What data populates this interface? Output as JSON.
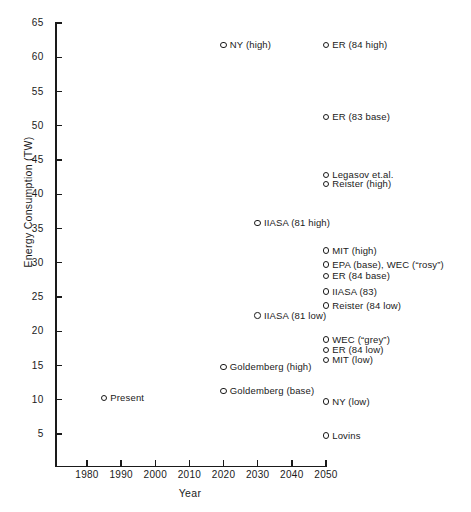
{
  "chart_data": {
    "type": "scatter",
    "title": "",
    "xlabel": "Year",
    "ylabel": "Energy Consumption (TW)",
    "xlim": [
      1972,
      2052
    ],
    "ylim": [
      0,
      65
    ],
    "xticks": [
      1980,
      1990,
      2000,
      2010,
      2020,
      2030,
      2040,
      2050
    ],
    "yticks": [
      5,
      10,
      15,
      20,
      25,
      30,
      35,
      40,
      45,
      50,
      55,
      60,
      65
    ],
    "grid": false,
    "legend": "none",
    "marker": "open-circle",
    "points": [
      {
        "label": "Present",
        "x": 1985,
        "y": 10.5,
        "label_side": "right"
      },
      {
        "label": "NY (high)",
        "x": 2020,
        "y": 62.0,
        "label_side": "right"
      },
      {
        "label": "ER (84 high)",
        "x": 2050,
        "y": 62.0,
        "label_side": "right"
      },
      {
        "label": "ER (83 base)",
        "x": 2050,
        "y": 51.5,
        "label_side": "right"
      },
      {
        "label": "Legasov et.al.",
        "x": 2050,
        "y": 43.0,
        "label_side": "right"
      },
      {
        "label": "Reister (high)",
        "x": 2050,
        "y": 41.7,
        "label_side": "right"
      },
      {
        "label": "IIASA (81 high)",
        "x": 2030,
        "y": 36.0,
        "label_side": "right"
      },
      {
        "label": "MIT (high)",
        "x": 2050,
        "y": 32.0,
        "label_side": "right"
      },
      {
        "label": "EPA (base), WEC (“rosy”)",
        "x": 2050,
        "y": 30.0,
        "label_side": "right"
      },
      {
        "label": "ER  (84 base)",
        "x": 2050,
        "y": 28.3,
        "label_side": "right"
      },
      {
        "label": "IIASA (83)",
        "x": 2050,
        "y": 26.0,
        "label_side": "right"
      },
      {
        "label": "Reister  (84 low)",
        "x": 2050,
        "y": 24.0,
        "label_side": "right"
      },
      {
        "label": "IIASA (81 low)",
        "x": 2030,
        "y": 22.5,
        "label_side": "right"
      },
      {
        "label": "WEC (“grey”)",
        "x": 2050,
        "y": 19.0,
        "label_side": "right"
      },
      {
        "label": "ER (84 low)",
        "x": 2050,
        "y": 17.5,
        "label_side": "right"
      },
      {
        "label": "MIT (low)",
        "x": 2050,
        "y": 16.0,
        "label_side": "right"
      },
      {
        "label": "Goldemberg (high)",
        "x": 2020,
        "y": 15.0,
        "label_side": "right"
      },
      {
        "label": "Goldemberg (base)",
        "x": 2020,
        "y": 11.5,
        "label_side": "right"
      },
      {
        "label": "NY (low)",
        "x": 2050,
        "y": 10.0,
        "label_side": "right"
      },
      {
        "label": "Lovins",
        "x": 2050,
        "y": 5.0,
        "label_side": "right"
      }
    ]
  },
  "colors": {
    "ink": "#1a1a1a",
    "background": "#ffffff"
  }
}
